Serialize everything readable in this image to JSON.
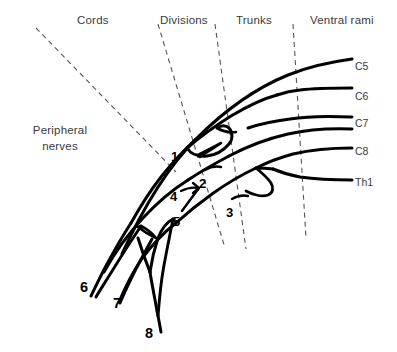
{
  "figure": {
    "title_labels": [
      {
        "id": "cords",
        "text": "Cords",
        "x": 77,
        "y": 14
      },
      {
        "id": "divisions",
        "text": "Divisions",
        "x": 160,
        "y": 14
      },
      {
        "id": "trunks",
        "text": "Trunks",
        "x": 236,
        "y": 14
      },
      {
        "id": "ventral-rami",
        "text": "Ventral rami",
        "x": 310,
        "y": 14
      }
    ],
    "side_label": {
      "id": "peripheral-nerves",
      "line1": "Peripheral",
      "line2": "nerves",
      "x": 14,
      "y": 122
    },
    "segment_labels": [
      {
        "id": "c5",
        "text": "C5",
        "x": 355,
        "y": 60
      },
      {
        "id": "c6",
        "text": "C6",
        "x": 355,
        "y": 90
      },
      {
        "id": "c7",
        "text": "C7",
        "x": 355,
        "y": 117
      },
      {
        "id": "c8",
        "text": "C8",
        "x": 355,
        "y": 145
      },
      {
        "id": "th1",
        "text": "Th1",
        "x": 355,
        "y": 176
      }
    ],
    "number_labels": [
      {
        "id": "n1",
        "text": "1",
        "x": 171,
        "y": 149,
        "size": "small"
      },
      {
        "id": "n2",
        "text": "2",
        "x": 199,
        "y": 176,
        "size": "small"
      },
      {
        "id": "n3",
        "text": "3",
        "x": 226,
        "y": 205,
        "size": "small"
      },
      {
        "id": "n4",
        "text": "4",
        "x": 170,
        "y": 189,
        "size": "small"
      },
      {
        "id": "n5",
        "text": "5",
        "x": 173,
        "y": 214,
        "size": "small"
      },
      {
        "id": "n6",
        "text": "6",
        "x": 80,
        "y": 279,
        "size": "big"
      },
      {
        "id": "n7",
        "text": "7",
        "x": 113,
        "y": 295,
        "size": "big"
      },
      {
        "id": "n8",
        "text": "8",
        "x": 145,
        "y": 325,
        "size": "big"
      }
    ],
    "colors": {
      "background": "#ffffff",
      "nerve_stroke": "#000000",
      "dashed_stroke": "#555555",
      "label_text": "#3a3a3a",
      "number_text": "#000000"
    },
    "divider_lines": [
      {
        "id": "divider-peripheral-cords",
        "x1": 36,
        "y1": 28,
        "x2": 175,
        "y2": 170
      },
      {
        "id": "divider-cords-divisions",
        "x1": 158,
        "y1": 24,
        "x2": 224,
        "y2": 247
      },
      {
        "id": "divider-divisions-trunks",
        "x1": 215,
        "y1": 24,
        "x2": 245,
        "y2": 248
      },
      {
        "id": "divider-trunks-rami",
        "x1": 293,
        "y1": 24,
        "x2": 305,
        "y2": 237
      }
    ]
  }
}
